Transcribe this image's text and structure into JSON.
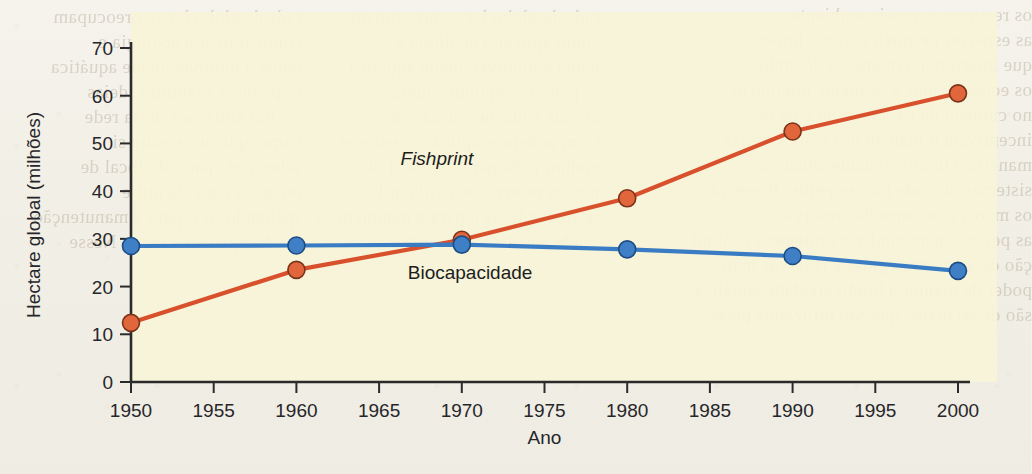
{
  "page": {
    "background_color": "#f2efe6",
    "bleed_text_left": "rads de globo lar se preocupam\ncomo aplicar a ecologia e\ntenha a biodiversidade aquática\nre poderos seguintes ideias\nas, nas situações desta rede\ncomo aplicar os entre si\nsaber cada parte do local de\nrecursos e a vida util e\nspeitando-as o para a manutenção\nsaúde aquática e nossa Nesse",
    "bleed_text_mid": "rads de globo lar se preocupam\ncomo aplicar a ecologia e\ntenha a biodiversidade aquática\nre poderos seguintes ideias\nas, nas situações desta rede\nCom podemos aplicar os entre si\nmelhor cada parte do local de\nnossas reservas e a vida util\nrespeitando-as o para a manutenção\nsaúde aquática e nossa Nesse",
    "bleed_text_right": "os recursos e o meio ambiente\nas espécies pesqueiras (ou é importa\nque interfere na interação do ambi\nos ecossistemas e os meios internacio\nno cuidado da casa comum e os re\nincentivam o manejo dos ecossistemas\nmaneira a biodiversidade aquática\nsistemas de onde isso se perde. Preserva\nos mares e oceanos das reservas\nas pessoas para ajudar a proteger a ecologi\nção de áreas protegidas e reservas mari\npoder de manter a biodiversidade aquática\nsão de recursos, que são utilizados pelas"
  },
  "chart_data": {
    "type": "line",
    "title": "",
    "xlabel": "Ano",
    "ylabel": "Hectare global (milhões)",
    "x": [
      1950,
      1960,
      1970,
      1980,
      1990,
      2000
    ],
    "xtick_labels": [
      "1950",
      "1955",
      "1960",
      "1965",
      "1970",
      "1975",
      "1980",
      "1985",
      "1990",
      "1995",
      "2000"
    ],
    "xtick_values": [
      1950,
      1955,
      1960,
      1965,
      1970,
      1975,
      1980,
      1985,
      1990,
      1995,
      2000
    ],
    "ytick_labels": [
      "0",
      "10",
      "20",
      "30",
      "40",
      "50",
      "60",
      "70"
    ],
    "ytick_values": [
      0,
      10,
      20,
      30,
      40,
      50,
      60,
      70
    ],
    "xlim": [
      1950,
      2000
    ],
    "ylim": [
      0,
      70
    ],
    "grid": false,
    "legend_position": "inline-annotation",
    "plot_background": "#f7f4d8",
    "series": [
      {
        "name": "Fishprint",
        "color": "#d8502c",
        "marker_fill": "#e2663c",
        "marker_edge": "#7a3318",
        "italic": true,
        "label_x": 1968.5,
        "label_y": 45.5,
        "values": [
          12.4,
          23.5,
          29.8,
          38.5,
          52.5,
          60.5
        ]
      },
      {
        "name": "Biocapacidade",
        "color": "#3a7cc4",
        "marker_fill": "#3f7fc6",
        "marker_edge": "#1d4c85",
        "italic": false,
        "label_x": 1970.5,
        "label_y": 21.5,
        "values": [
          28.5,
          28.6,
          28.8,
          27.8,
          26.4,
          23.3
        ]
      }
    ]
  }
}
